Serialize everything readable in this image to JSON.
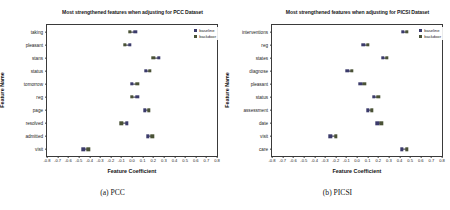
{
  "figure": {
    "width": 450,
    "height": 210,
    "colors": {
      "baseline": "#3b3b6b",
      "backdoor": "#4a5236",
      "axis": "#3a3a3a"
    }
  },
  "panels": [
    {
      "key": "pcc",
      "caption": "(a) PCC",
      "legend": [
        {
          "label": "baseline",
          "series": "baseline"
        },
        {
          "label": "backdoor",
          "series": "backdoor"
        }
      ],
      "chart_data": {
        "type": "scatter",
        "title": "Most strengthened features when adjusting for PCC Dataset",
        "xlabel": "Feature Coefficient",
        "ylabel": "Feature Name",
        "xlim": [
          -0.8,
          0.8
        ],
        "xticks": [
          -0.8,
          -0.7,
          -0.6,
          -0.5,
          -0.4,
          -0.3,
          -0.2,
          -0.1,
          0.0,
          0.1,
          0.2,
          0.3,
          0.4,
          0.5,
          0.6,
          0.7,
          0.8
        ],
        "xticklabels": [
          "-0.8",
          "-0.7",
          "-0.6",
          "-0.5",
          "-0.4",
          "-0.3",
          "-0.2",
          "-0.1",
          "0.0",
          "0.1",
          "0.2",
          "0.3",
          "0.4",
          "0.5",
          "0.6",
          "0.7",
          "0.8"
        ],
        "grid": false,
        "legend_position": "upper right",
        "categories": [
          "taking",
          "pleasant",
          "stans",
          "status",
          "tomorrow",
          "reg",
          "page",
          "resolved",
          "admitted",
          "visit"
        ],
        "series": [
          {
            "name": "baseline",
            "values": [
              0.03,
              -0.02,
              0.25,
              0.13,
              0.0,
              0.05,
              0.12,
              -0.05,
              0.15,
              -0.46
            ]
          },
          {
            "name": "backdoor",
            "values": [
              -0.02,
              -0.07,
              0.2,
              0.17,
              0.05,
              0.0,
              0.16,
              -0.1,
              0.19,
              -0.41
            ]
          }
        ]
      }
    },
    {
      "key": "picsi",
      "caption": "(b) PICSI",
      "legend": [
        {
          "label": "baseline",
          "series": "baseline"
        },
        {
          "label": "backdoor",
          "series": "backdoor"
        }
      ],
      "chart_data": {
        "type": "scatter",
        "title": "Most strengthened features when adjusting for PICSI Dataset",
        "xlabel": "Feature Coefficient",
        "ylabel": "Feature Name",
        "xlim": [
          -0.8,
          0.8
        ],
        "xticks": [
          -0.8,
          -0.7,
          -0.6,
          -0.5,
          -0.4,
          -0.3,
          -0.2,
          -0.1,
          0.0,
          0.1,
          0.2,
          0.3,
          0.4,
          0.5,
          0.6,
          0.7,
          0.8
        ],
        "xticklabels": [
          "-0.8",
          "-0.7",
          "-0.6",
          "-0.5",
          "-0.4",
          "-0.3",
          "-0.2",
          "-0.1",
          "0.0",
          "0.1",
          "0.2",
          "0.3",
          "0.4",
          "0.5",
          "0.6",
          "0.7",
          "0.8"
        ],
        "grid": false,
        "legend_position": "upper right",
        "categories": [
          "interventions",
          "reg",
          "states",
          "diagnose",
          "pleasant",
          "status",
          "assessment",
          "date",
          "visit",
          "care"
        ],
        "series": [
          {
            "name": "baseline",
            "values": [
              0.43,
              0.06,
              0.24,
              -0.09,
              0.03,
              0.16,
              0.1,
              0.19,
              -0.25,
              0.42
            ]
          },
          {
            "name": "backdoor",
            "values": [
              0.47,
              0.1,
              0.28,
              -0.05,
              0.07,
              0.2,
              0.14,
              0.23,
              -0.2,
              0.47
            ]
          }
        ]
      }
    }
  ]
}
